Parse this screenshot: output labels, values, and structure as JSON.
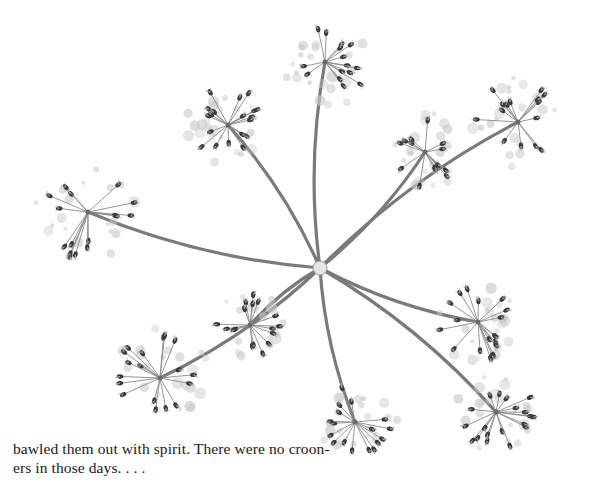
{
  "page": {
    "type": "book-page",
    "background": "#fefefe"
  },
  "figure": {
    "hub": {
      "x": 320,
      "y": 268
    },
    "stem_color": "#7a7a7a",
    "seed_color": "#3a3a3a",
    "floret_color": "#c8c8c8",
    "umbellets": [
      {
        "id": "top",
        "x": 325,
        "y": 62,
        "r": 42
      },
      {
        "id": "top-left",
        "x": 228,
        "y": 125,
        "r": 38
      },
      {
        "id": "left",
        "x": 88,
        "y": 212,
        "r": 50
      },
      {
        "id": "upper-right",
        "x": 425,
        "y": 152,
        "r": 36
      },
      {
        "id": "far-right-top",
        "x": 518,
        "y": 122,
        "r": 42
      },
      {
        "id": "right-middle",
        "x": 478,
        "y": 322,
        "r": 40
      },
      {
        "id": "bottom-right",
        "x": 496,
        "y": 412,
        "r": 38
      },
      {
        "id": "bottom-middle",
        "x": 355,
        "y": 422,
        "r": 40
      },
      {
        "id": "bottom-left",
        "x": 160,
        "y": 378,
        "r": 46
      },
      {
        "id": "lower-left-inner",
        "x": 250,
        "y": 325,
        "r": 34
      }
    ]
  },
  "text": {
    "line1": "bawled them out with spirit. There were no croon-",
    "line2": "ers in those days. . . ."
  }
}
